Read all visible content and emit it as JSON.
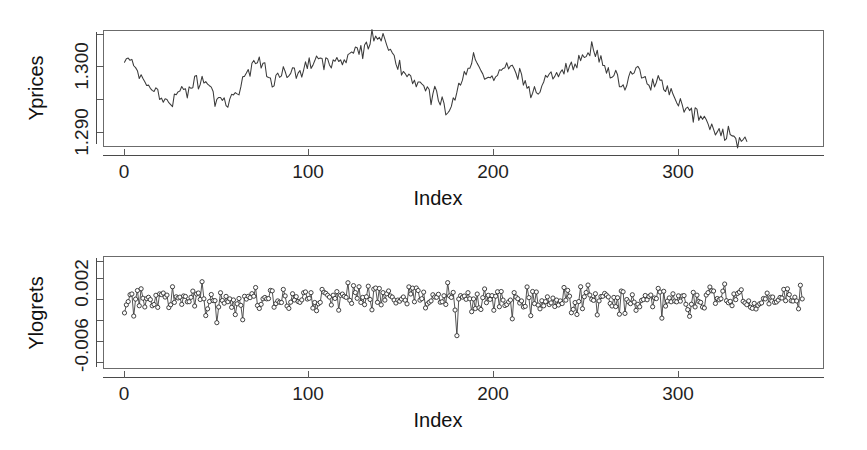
{
  "figure": {
    "title": "",
    "background": "#ffffff",
    "line_color": "#3b3b3b",
    "point_stroke_color": "#2e2e2e",
    "point_fill_color": "#ffffff",
    "axis_color": "#5a5a5a"
  },
  "panels": {
    "prices": {
      "ylabel": "Yprices",
      "xlabel": "Index",
      "ytick_labels": [
        "1.300",
        "1.290"
      ],
      "xtick_labels": [
        "0",
        "100",
        "200",
        "300"
      ]
    },
    "logrets": {
      "ylabel": "Ylogrets",
      "xlabel": "Index",
      "ytick_labels": [
        "0.002",
        "-0.006"
      ],
      "xtick_labels": [
        "0",
        "100",
        "200",
        "300"
      ]
    }
  },
  "chart_data": [
    {
      "type": "line",
      "name": "prices-panel",
      "title": "",
      "xlabel": "Index",
      "ylabel": "Yprices",
      "xlim": [
        0,
        368
      ],
      "ylim": [
        1.2862,
        1.3043
      ],
      "xticks": [
        0,
        100,
        200,
        300
      ],
      "xtick_labels": [
        "0",
        "100",
        "200",
        "300"
      ],
      "yticks": [
        1.304,
        1.3,
        1.295,
        1.29
      ],
      "ytick_labels": [
        "",
        "1.300",
        "",
        "1.290"
      ],
      "grid": false,
      "legend": false,
      "marker": "none",
      "n_points": 368,
      "x": [
        0,
        1,
        2,
        3,
        4,
        5,
        6,
        7,
        8,
        9,
        10,
        11,
        12,
        13,
        14,
        15,
        16,
        17,
        18,
        19,
        20,
        21,
        22,
        23,
        24,
        25,
        26,
        27,
        28,
        29,
        30,
        31,
        32,
        33,
        34,
        35,
        36,
        37,
        38,
        39,
        40,
        41,
        42,
        43,
        44,
        45,
        46,
        47,
        48,
        49,
        50,
        51,
        52,
        53,
        54,
        55,
        56,
        57,
        58,
        59,
        60,
        61,
        62,
        63,
        64,
        65,
        66,
        67,
        68,
        69,
        70,
        71,
        72,
        73,
        74,
        75,
        76,
        77,
        78,
        79,
        80,
        81,
        82,
        83,
        84,
        85,
        86,
        87,
        88,
        89,
        90,
        91,
        92,
        93,
        94,
        95,
        96,
        97,
        98,
        99,
        100,
        101,
        102,
        103,
        104,
        105,
        106,
        107,
        108,
        109,
        110,
        111,
        112,
        113,
        114,
        115,
        116,
        117,
        118,
        119,
        120,
        121,
        122,
        123,
        124,
        125,
        126,
        127,
        128,
        129,
        130,
        131,
        132,
        133,
        134,
        135,
        136,
        137,
        138,
        139,
        140,
        141,
        142,
        143,
        144,
        145,
        146,
        147,
        148,
        149,
        150,
        151,
        152,
        153,
        154,
        155,
        156,
        157,
        158,
        159,
        160,
        161,
        162,
        163,
        164,
        165,
        166,
        167,
        168,
        169,
        170,
        171,
        172,
        173,
        174,
        175,
        176,
        177,
        178,
        179,
        180,
        181,
        182,
        183,
        184,
        185,
        186,
        187,
        188,
        189,
        190,
        191,
        192,
        193,
        194,
        195,
        196,
        197,
        198,
        199,
        200,
        201,
        202,
        203,
        204,
        205,
        206,
        207,
        208,
        209,
        210,
        211,
        212,
        213,
        214,
        215,
        216,
        217,
        218,
        219,
        220,
        221,
        222,
        223,
        224,
        225,
        226,
        227,
        228,
        229,
        230,
        231,
        232,
        233,
        234,
        235,
        236,
        237,
        238,
        239,
        240,
        241,
        242,
        243,
        244,
        245,
        246,
        247,
        248,
        249,
        250,
        251,
        252,
        253,
        254,
        255,
        256,
        257,
        258,
        259,
        260,
        261,
        262,
        263,
        264,
        265,
        266,
        267,
        268,
        269,
        270,
        271,
        272,
        273,
        274,
        275,
        276,
        277,
        278,
        279,
        280,
        281,
        282,
        283,
        284,
        285,
        286,
        287,
        288,
        289,
        290,
        291,
        292,
        293,
        294,
        295,
        296,
        297,
        298,
        299,
        300,
        301,
        302,
        303,
        304,
        305,
        306,
        307,
        308,
        309,
        310,
        311,
        312,
        313,
        314,
        315,
        316,
        317,
        318,
        319,
        320,
        321,
        322,
        323,
        324,
        325,
        326,
        327,
        328,
        329,
        330,
        331,
        332,
        333,
        334,
        335,
        336,
        337,
        338,
        339,
        340,
        341,
        342,
        343,
        344,
        345,
        346,
        347,
        348,
        349,
        350,
        351,
        352,
        353,
        354,
        355,
        356,
        357,
        358,
        359,
        360,
        361,
        362,
        363,
        364,
        365,
        366,
        367
      ],
      "y": [
        1.2994,
        1.2989,
        1.2999,
        1.2993,
        1.3002,
        1.2994,
        1.2983,
        1.2976,
        1.2972,
        1.2968,
        1.2963,
        1.2966,
        1.2959,
        1.2955,
        1.2957,
        1.2951,
        1.2949,
        1.2953,
        1.2947,
        1.2941,
        1.2936,
        1.2931,
        1.2928,
        1.2934,
        1.2929,
        1.2927,
        1.2933,
        1.2939,
        1.2936,
        1.2942,
        1.2951,
        1.2958,
        1.2952,
        1.2947,
        1.2944,
        1.2949,
        1.2956,
        1.2963,
        1.2971,
        1.2966,
        1.2959,
        1.2963,
        1.2968,
        1.2962,
        1.2957,
        1.2961,
        1.2956,
        1.2949,
        1.2944,
        1.2939,
        1.2934,
        1.2938,
        1.2933,
        1.2929,
        1.2936,
        1.2931,
        1.2927,
        1.2934,
        1.2941,
        1.2947,
        1.2943,
        1.2938,
        1.2944,
        1.2951,
        1.2959,
        1.2966,
        1.2974,
        1.2981,
        1.2976,
        1.2984,
        1.2991,
        1.2997,
        1.2993,
        1.2999,
        1.2994,
        1.2988,
        1.2982,
        1.2976,
        1.2969,
        1.2963,
        1.2958,
        1.2962,
        1.2968,
        1.2973,
        1.2967,
        1.2972,
        1.2979,
        1.2974,
        1.2968,
        1.2973,
        1.2979,
        1.2984,
        1.2978,
        1.2972,
        1.2976,
        1.2982,
        1.2977,
        1.2983,
        1.2989,
        1.2984,
        1.2991,
        1.2986,
        1.2992,
        1.2998,
        1.3004,
        1.2999,
        1.3005,
        1.3001,
        1.2996,
        1.3002,
        1.2997,
        1.2992,
        1.2986,
        1.2991,
        1.2997,
        1.3002,
        1.2998,
        1.3003,
        1.2999,
        1.2994,
        1.2999,
        1.3005,
        1.3001,
        1.3006,
        1.3002,
        1.3008,
        1.3013,
        1.3009,
        1.3016,
        1.3011,
        1.3018,
        1.3024,
        1.3019,
        1.3026,
        1.3032,
        1.3027,
        1.3021,
        1.3028,
        1.3034,
        1.3029,
        1.3036,
        1.3031,
        1.3024,
        1.3017,
        1.3011,
        1.3004,
        1.2998,
        1.2993,
        1.2988,
        1.2982,
        1.2977,
        1.2983,
        1.2978,
        1.2972,
        1.2967,
        1.2973,
        1.2968,
        1.2962,
        1.2957,
        1.2963,
        1.2958,
        1.2953,
        1.2959,
        1.2954,
        1.2948,
        1.2943,
        1.2938,
        1.2943,
        1.2948,
        1.2944,
        1.2939,
        1.2934,
        1.2929,
        1.2923,
        1.2918,
        1.2913,
        1.2919,
        1.2925,
        1.2931,
        1.2938,
        1.2944,
        1.2951,
        1.2957,
        1.2963,
        1.2969,
        1.2976,
        1.2982,
        1.2989,
        1.2995,
        1.3001,
        1.2996,
        1.2991,
        1.2986,
        1.2981,
        1.2976,
        1.2971,
        1.2966,
        1.2972,
        1.2967,
        1.2973,
        1.2968,
        1.2974,
        1.2979,
        1.2975,
        1.2981,
        1.2986,
        1.2982,
        1.2987,
        1.2983,
        1.2978,
        1.2984,
        1.2979,
        1.2974,
        1.2969,
        1.2975,
        1.2971,
        1.2966,
        1.2961,
        1.2956,
        1.2951,
        1.2946,
        1.2941,
        1.2947,
        1.2942,
        1.2948,
        1.2953,
        1.2959,
        1.2964,
        1.2969,
        1.2975,
        1.2971,
        1.2977,
        1.2972,
        1.2978,
        1.2974,
        1.2979,
        1.2975,
        1.2981,
        1.2976,
        1.2982,
        1.2978,
        1.2984,
        1.2989,
        1.2985,
        1.2991,
        1.2996,
        1.3002,
        1.2998,
        1.3004,
        1.3009,
        1.3005,
        1.3011,
        1.3007,
        1.3013,
        1.3008,
        1.3003,
        1.2998,
        1.3004,
        1.2999,
        1.2993,
        1.2988,
        1.2982,
        1.2976,
        1.2971,
        1.2977,
        1.2972,
        1.2978,
        1.2973,
        1.2968,
        1.2963,
        1.2958,
        1.2953,
        1.2959,
        1.2964,
        1.297,
        1.2976,
        1.2982,
        1.2988,
        1.2983,
        1.2978,
        1.2973,
        1.2968,
        1.2963,
        1.2958,
        1.2953,
        1.2948,
        1.2954,
        1.2959,
        1.2965,
        1.2971,
        1.2966,
        1.2961,
        1.2956,
        1.2951,
        1.2946,
        1.2941,
        1.2947,
        1.2942,
        1.2937,
        1.2932,
        1.2927,
        1.2933,
        1.2928,
        1.2923,
        1.2918,
        1.2924,
        1.2919,
        1.2914,
        1.2909,
        1.2915,
        1.291,
        1.2905,
        1.29,
        1.2906,
        1.2901,
        1.2896,
        1.2891,
        1.2886,
        1.2892,
        1.2887,
        1.2882,
        1.2888,
        1.2883,
        1.2878,
        1.2884,
        1.2879,
        1.2874,
        1.288,
        1.2875,
        1.287,
        1.2876,
        1.2871,
        1.2866,
        1.2872,
        1.2867,
        1.2873,
        1.2868,
        1.2874
      ]
    },
    {
      "type": "scatter",
      "name": "logrets-panel",
      "title": "",
      "xlabel": "Index",
      "ylabel": "Ylogrets",
      "xlim": [
        0,
        368
      ],
      "ylim": [
        -0.0072,
        0.0035
      ],
      "xticks": [
        0,
        100,
        200,
        300
      ],
      "xtick_labels": [
        "0",
        "100",
        "200",
        "300"
      ],
      "yticks": [
        0.002,
        0.0,
        -0.002,
        -0.004,
        -0.006
      ],
      "ytick_labels": [
        "0.002",
        "",
        "",
        "",
        "-0.006"
      ],
      "grid": false,
      "legend": false,
      "marker": "open-circle",
      "connected": true,
      "n_points": 368,
      "mean": -0.0005,
      "sd": 0.0006,
      "note": "log returns fluctuating narrowly around a slightly negative mean"
    }
  ]
}
